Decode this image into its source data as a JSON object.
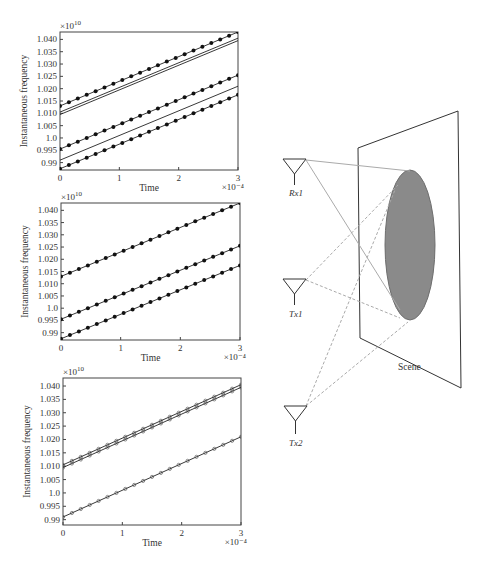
{
  "panels": [
    {
      "id": "top",
      "exponent_label": "×10",
      "exponent_power": "10",
      "ylabel": "Instantaneous frequency",
      "xlabel": "Time",
      "x_exponent_label": "×10⁻⁴"
    },
    {
      "id": "middle",
      "exponent_label": "×10",
      "exponent_power": "10",
      "ylabel": "Instantaneous frequency",
      "xlabel": "Time",
      "x_exponent_label": "×10⁻⁴"
    },
    {
      "id": "bottom",
      "exponent_label": "×10",
      "exponent_power": "10",
      "ylabel": "Instantaneous frequency",
      "xlabel": "Time",
      "x_exponent_label": "×10⁻⁴"
    }
  ],
  "diagram": {
    "antennas": [
      {
        "label": "Rx1"
      },
      {
        "label": "Tx1"
      },
      {
        "label": "Tx2"
      }
    ],
    "scene_label": "Scene",
    "colors": {
      "ellipse_fill": "#8a8a8a",
      "ellipse_stroke": "#6e6e6e",
      "line": "#333333",
      "ray": "#aaaaaa"
    }
  },
  "chart_data": [
    {
      "type": "line",
      "title": "",
      "xlabel": "Time (×10⁻⁴)",
      "ylabel": "Instantaneous frequency (×10^10)",
      "xlim": [
        0,
        3
      ],
      "ylim": [
        0.987,
        1.043
      ],
      "x_ticks": [
        "0",
        "1",
        "2",
        "3"
      ],
      "y_ticks": [
        "0.99",
        "0.995",
        "1.0",
        "1.005",
        "1.010",
        "1.015",
        "1.020",
        "1.025",
        "1.030",
        "1.035",
        "1.040"
      ],
      "grid": false,
      "series": [
        {
          "name": "dotted-1",
          "marker": "dot",
          "x": [
            0,
            3
          ],
          "y": [
            1.013,
            1.043
          ]
        },
        {
          "name": "thin-1a",
          "marker": "none",
          "x": [
            0,
            3
          ],
          "y": [
            1.0105,
            1.0405
          ]
        },
        {
          "name": "thin-1b",
          "marker": "none",
          "x": [
            0,
            3
          ],
          "y": [
            1.0095,
            1.0395
          ]
        },
        {
          "name": "dotted-2",
          "marker": "dot",
          "x": [
            0,
            3
          ],
          "y": [
            0.9955,
            1.0255
          ]
        },
        {
          "name": "thin-2",
          "marker": "none",
          "x": [
            0,
            3
          ],
          "y": [
            0.991,
            1.021
          ]
        },
        {
          "name": "dotted-3",
          "marker": "dot",
          "x": [
            0,
            3
          ],
          "y": [
            0.9875,
            1.0175
          ]
        }
      ]
    },
    {
      "type": "line",
      "title": "",
      "xlabel": "Time (×10⁻⁴)",
      "ylabel": "Instantaneous frequency (×10^10)",
      "xlim": [
        0,
        3
      ],
      "ylim": [
        0.987,
        1.043
      ],
      "x_ticks": [
        "0",
        "1",
        "2",
        "3"
      ],
      "y_ticks": [
        "0.99",
        "0.995",
        "1.0",
        "1.005",
        "1.010",
        "1.015",
        "1.020",
        "1.025",
        "1.030",
        "1.035",
        "1.040"
      ],
      "grid": false,
      "series": [
        {
          "name": "dotted-1",
          "marker": "dot",
          "x": [
            0,
            3
          ],
          "y": [
            1.013,
            1.043
          ]
        },
        {
          "name": "dotted-2",
          "marker": "dot",
          "x": [
            0,
            3
          ],
          "y": [
            0.9955,
            1.0255
          ]
        },
        {
          "name": "dotted-3",
          "marker": "dot",
          "x": [
            0,
            3
          ],
          "y": [
            0.9875,
            1.0175
          ]
        }
      ]
    },
    {
      "type": "line",
      "title": "",
      "xlabel": "Time (×10⁻⁴)",
      "ylabel": "Instantaneous frequency (×10^10)",
      "xlim": [
        0,
        3
      ],
      "ylim": [
        0.988,
        1.043
      ],
      "x_ticks": [
        "0",
        "1",
        "2",
        "3"
      ],
      "y_ticks": [
        "0.99",
        "0.995",
        "1.0",
        "1.005",
        "1.010",
        "1.015",
        "1.020",
        "1.025",
        "1.030",
        "1.035",
        "1.040"
      ],
      "grid": false,
      "series": [
        {
          "name": "est-1a",
          "marker": "small-circle",
          "x": [
            0,
            3
          ],
          "y": [
            1.0105,
            1.0405
          ]
        },
        {
          "name": "est-1b",
          "marker": "small-circle",
          "x": [
            0,
            3
          ],
          "y": [
            1.0095,
            1.0395
          ]
        },
        {
          "name": "est-2",
          "marker": "small-circle",
          "x": [
            0,
            3
          ],
          "y": [
            0.991,
            1.021
          ]
        }
      ]
    }
  ]
}
